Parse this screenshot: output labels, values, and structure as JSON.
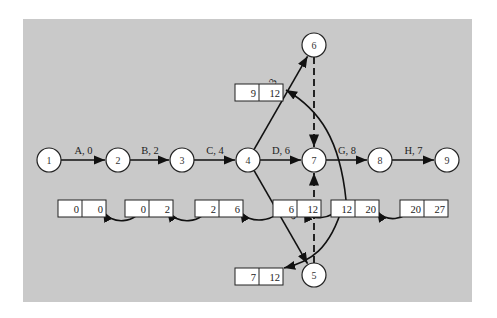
{
  "diagram": {
    "background": "#c9c9c9",
    "nodes": [
      {
        "id": "1",
        "x": 49,
        "y": 160
      },
      {
        "id": "2",
        "x": 118,
        "y": 160
      },
      {
        "id": "3",
        "x": 182,
        "y": 160
      },
      {
        "id": "4",
        "x": 248,
        "y": 160
      },
      {
        "id": "7",
        "x": 314,
        "y": 160
      },
      {
        "id": "8",
        "x": 380,
        "y": 160
      },
      {
        "id": "9",
        "x": 447,
        "y": 160
      },
      {
        "id": "6",
        "x": 314,
        "y": 45
      },
      {
        "id": "5",
        "x": 314,
        "y": 275
      }
    ],
    "activities": [
      {
        "label": "A, 0",
        "from": "1",
        "to": "2"
      },
      {
        "label": "B, 2",
        "from": "2",
        "to": "3"
      },
      {
        "label": "C, 4",
        "from": "3",
        "to": "4"
      },
      {
        "label": "D, 6",
        "from": "4",
        "to": "7"
      },
      {
        "label": "E, 3",
        "from": "4",
        "to": "6"
      },
      {
        "label": "F, 5",
        "from": "4",
        "to": "5"
      },
      {
        "label": "G, 8",
        "from": "7",
        "to": "8"
      },
      {
        "label": "H, 7",
        "from": "8",
        "to": "9"
      }
    ],
    "dummies": [
      {
        "from": "6",
        "to": "7"
      },
      {
        "from": "5",
        "to": "7"
      }
    ],
    "time_boxes": [
      {
        "left": "0",
        "right": "0",
        "x": 58,
        "y": 209
      },
      {
        "left": "0",
        "right": "2",
        "x": 125,
        "y": 209
      },
      {
        "left": "2",
        "right": "6",
        "x": 195,
        "y": 209
      },
      {
        "left": "6",
        "right": "12",
        "x": 273,
        "y": 209
      },
      {
        "left": "12",
        "right": "20",
        "x": 331,
        "y": 209
      },
      {
        "left": "20",
        "right": "27",
        "x": 400,
        "y": 209
      },
      {
        "left": "9",
        "right": "12",
        "x": 235,
        "y": 93
      },
      {
        "left": "7",
        "right": "12",
        "x": 235,
        "y": 277
      }
    ]
  }
}
